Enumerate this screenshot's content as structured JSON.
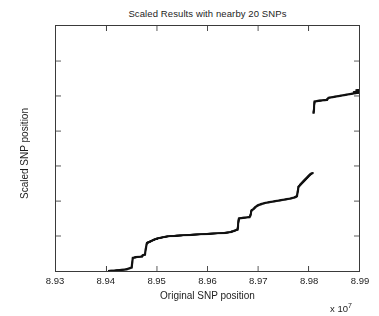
{
  "chart_data": {
    "type": "scatter",
    "title": "Scaled Results with nearby 20 SNPs",
    "xlabel": "Original SNP position",
    "ylabel": "Scaled SNP position",
    "x_multiplier_text": "x 10",
    "x_multiplier_exponent": "7",
    "xlim": [
      8.93,
      8.99
    ],
    "ylim": [
      0,
      1.4
    ],
    "xticks": [
      "8.93",
      "8.94",
      "8.95",
      "8.96",
      "8.97",
      "8.98",
      "8.99"
    ],
    "yticks": [
      "0",
      "0.2",
      "0.4",
      "0.6",
      "0.8",
      "1",
      "1.2",
      "1.4"
    ],
    "xtick_values": [
      8.93,
      8.94,
      8.95,
      8.96,
      8.97,
      8.98,
      8.99
    ],
    "ytick_values": [
      0,
      0.2,
      0.4,
      0.6,
      0.8,
      1.0,
      1.2,
      1.4
    ],
    "grid": false,
    "legend": "none",
    "marker": "square",
    "marker_color": "#111111",
    "marker_size_px": 2.1,
    "series": [
      {
        "name": "scaled SNP positions",
        "points": [
          [
            8.9405,
            0.0
          ],
          [
            8.9408,
            0.001
          ],
          [
            8.9411,
            0.002
          ],
          [
            8.9414,
            0.002
          ],
          [
            8.9417,
            0.003
          ],
          [
            8.942,
            0.004
          ],
          [
            8.9423,
            0.004
          ],
          [
            8.9426,
            0.005
          ],
          [
            8.9429,
            0.006
          ],
          [
            8.9432,
            0.007
          ],
          [
            8.9435,
            0.008
          ],
          [
            8.9438,
            0.009
          ],
          [
            8.9441,
            0.011
          ],
          [
            8.9443,
            0.013
          ],
          [
            8.9445,
            0.015
          ],
          [
            8.9447,
            0.017
          ],
          [
            8.9449,
            0.019
          ],
          [
            8.945,
            0.021
          ],
          [
            8.94505,
            0.038
          ],
          [
            8.9452,
            0.075
          ],
          [
            8.9455,
            0.077
          ],
          [
            8.9458,
            0.079
          ],
          [
            8.9461,
            0.08
          ],
          [
            8.9464,
            0.081
          ],
          [
            8.9467,
            0.082
          ],
          [
            8.947,
            0.083
          ],
          [
            8.9472,
            0.09
          ],
          [
            8.9474,
            0.092
          ],
          [
            8.9476,
            0.094
          ],
          [
            8.9478,
            0.13
          ],
          [
            8.948,
            0.16
          ],
          [
            8.9483,
            0.164
          ],
          [
            8.9486,
            0.168
          ],
          [
            8.9489,
            0.172
          ],
          [
            8.9492,
            0.176
          ],
          [
            8.9495,
            0.18
          ],
          [
            8.9498,
            0.183
          ],
          [
            8.9501,
            0.186
          ],
          [
            8.9505,
            0.189
          ],
          [
            8.9509,
            0.191
          ],
          [
            8.9513,
            0.194
          ],
          [
            8.9517,
            0.196
          ],
          [
            8.9521,
            0.198
          ],
          [
            8.9525,
            0.199
          ],
          [
            8.953,
            0.2
          ],
          [
            8.9535,
            0.201
          ],
          [
            8.954,
            0.202
          ],
          [
            8.9545,
            0.203
          ],
          [
            8.955,
            0.204
          ],
          [
            8.9556,
            0.205
          ],
          [
            8.9562,
            0.206
          ],
          [
            8.9568,
            0.207
          ],
          [
            8.9574,
            0.208
          ],
          [
            8.958,
            0.209
          ],
          [
            8.9586,
            0.21
          ],
          [
            8.9592,
            0.211
          ],
          [
            8.9598,
            0.212
          ],
          [
            8.9604,
            0.213
          ],
          [
            8.961,
            0.214
          ],
          [
            8.9616,
            0.215
          ],
          [
            8.9622,
            0.216
          ],
          [
            8.9628,
            0.217
          ],
          [
            8.9634,
            0.218
          ],
          [
            8.964,
            0.22
          ],
          [
            8.9645,
            0.222
          ],
          [
            8.9648,
            0.225
          ],
          [
            8.9651,
            0.228
          ],
          [
            8.9654,
            0.231
          ],
          [
            8.9656,
            0.234
          ],
          [
            8.9658,
            0.236
          ],
          [
            8.96595,
            0.237
          ],
          [
            8.9662,
            0.3
          ],
          [
            8.9665,
            0.302
          ],
          [
            8.9668,
            0.303
          ],
          [
            8.9671,
            0.304
          ],
          [
            8.9674,
            0.305
          ],
          [
            8.9677,
            0.306
          ],
          [
            8.968,
            0.307
          ],
          [
            8.9683,
            0.308
          ],
          [
            8.96845,
            0.312
          ],
          [
            8.9687,
            0.345
          ],
          [
            8.969,
            0.352
          ],
          [
            8.9693,
            0.36
          ],
          [
            8.9696,
            0.368
          ],
          [
            8.9699,
            0.374
          ],
          [
            8.9702,
            0.378
          ],
          [
            8.9705,
            0.381
          ],
          [
            8.9708,
            0.384
          ],
          [
            8.9712,
            0.387
          ],
          [
            8.9716,
            0.39
          ],
          [
            8.972,
            0.392
          ],
          [
            8.9724,
            0.394
          ],
          [
            8.9728,
            0.396
          ],
          [
            8.9732,
            0.398
          ],
          [
            8.9736,
            0.4
          ],
          [
            8.974,
            0.402
          ],
          [
            8.9744,
            0.404
          ],
          [
            8.9748,
            0.406
          ],
          [
            8.9752,
            0.408
          ],
          [
            8.9756,
            0.41
          ],
          [
            8.976,
            0.412
          ],
          [
            8.9764,
            0.414
          ],
          [
            8.9768,
            0.417
          ],
          [
            8.9772,
            0.42
          ],
          [
            8.9775,
            0.424
          ],
          [
            8.9777,
            0.428
          ],
          [
            8.97785,
            0.45
          ],
          [
            8.978,
            0.48
          ],
          [
            8.9782,
            0.487
          ],
          [
            8.9784,
            0.494
          ],
          [
            8.9786,
            0.5
          ],
          [
            8.9788,
            0.506
          ],
          [
            8.979,
            0.512
          ],
          [
            8.9792,
            0.518
          ],
          [
            8.9794,
            0.524
          ],
          [
            8.9796,
            0.53
          ],
          [
            8.9798,
            0.536
          ],
          [
            8.98,
            0.542
          ],
          [
            8.9802,
            0.548
          ],
          [
            8.9804,
            0.553
          ],
          [
            8.9806,
            0.557
          ],
          [
            8.9808,
            0.56
          ],
          [
            8.981,
            0.905
          ],
          [
            8.9812,
            0.968
          ],
          [
            8.9815,
            0.97
          ],
          [
            8.9818,
            0.972
          ],
          [
            8.9821,
            0.973
          ],
          [
            8.9824,
            0.974
          ],
          [
            8.9827,
            0.975
          ],
          [
            8.983,
            0.976
          ],
          [
            8.9833,
            0.977
          ],
          [
            8.9836,
            0.978
          ],
          [
            8.984,
            0.99
          ],
          [
            8.9844,
            0.992
          ],
          [
            8.9848,
            0.994
          ],
          [
            8.9852,
            0.996
          ],
          [
            8.9856,
            0.998
          ],
          [
            8.986,
            1.0
          ],
          [
            8.9864,
            1.002
          ],
          [
            8.9868,
            1.004
          ],
          [
            8.9872,
            1.006
          ],
          [
            8.9876,
            1.008
          ],
          [
            8.988,
            1.01
          ],
          [
            8.9884,
            1.012
          ],
          [
            8.9888,
            1.014
          ],
          [
            8.9892,
            1.016
          ],
          [
            8.9896,
            1.018
          ],
          [
            8.99,
            1.019
          ],
          [
            8.989,
            1.022
          ],
          [
            8.9894,
            1.024
          ],
          [
            8.9898,
            1.026
          ],
          [
            8.9902,
            1.028
          ],
          [
            8.9905,
            1.03
          ],
          [
            8.9908,
            1.031
          ],
          [
            8.9895,
            1.033
          ],
          [
            8.9899,
            1.034
          ]
        ]
      }
    ],
    "annotations": [
      {
        "text": "isolated outlier point",
        "x": 8.981,
        "y": 0.905
      }
    ]
  }
}
